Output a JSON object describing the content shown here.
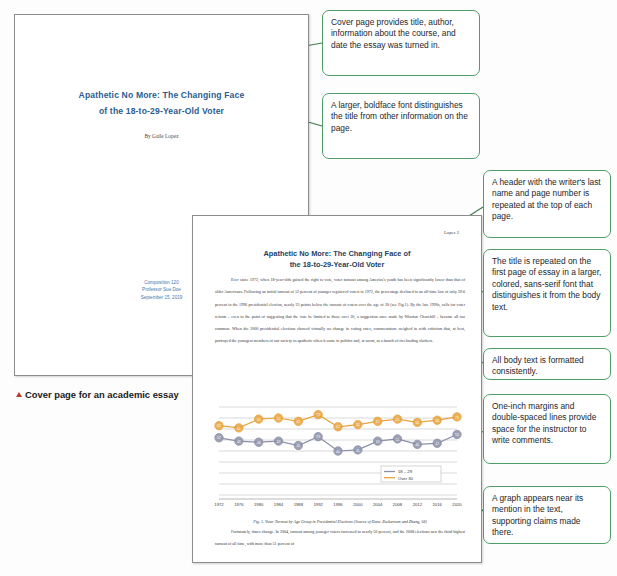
{
  "figure_label": {
    "marker": "triangle-up-icon",
    "text": "Cover page for an academic essay"
  },
  "cover_page": {
    "title_line1": "Apathetic No More: The Changing Face",
    "title_line2": "of the 18-to-29-Year-Old Voter",
    "author": "By Gaile Lopez",
    "course": "Composition 120",
    "instructor": "Professor Sue Doe",
    "date": "September 15, 2019",
    "title_color": "#2b5d8f",
    "courseinfo_color": "#3f79ad"
  },
  "essay_page": {
    "running_header": "Lopez 2",
    "title_line1": "Apathetic No More: The Changing Face of",
    "title_line2": "the 18-to-29-Year-Old Voter",
    "title_color": "#1d3f63",
    "body_paragraph_1": "Ever since 1972, when 18-year-olds gained the right to vote, voter turnout among America's youth has been significantly lower than that of older Americans. Following an initial turnout of 52 percent of younger registered voters in 1972, the percentage declined to an all-time low of only 39.6 percent in the 1996 presidential election, nearly 25 points below the turnout of voters over the age of 30 (see Fig.1). By the late 1990s, calls for voter reform – even to the point of suggesting that the vote be limited to those over 30, a suggestion once made by Winston Churchill – became all too common. When the 2000 presidential elections showed virtually no change in voting rates, commentators weighed in with criticism that, at best, portrayed the youngest members of our society as apathetic when it came to politics and, at worst, as a bunch of freeloading slackers.",
    "figure_caption": "Fig. 1. Voter Turnout by Age Group in Presidential Elections (Source of Data: Zuckerman and Zhang, 58)",
    "body_paragraph_2": "Fortunately, times change. In 2004, turnout among younger voters increased to nearly 50 percent, and the 2008 elections saw the third highest turnout of all time, with more than 51 percent of"
  },
  "chart_data": {
    "type": "line",
    "title": "",
    "xlabel": "",
    "ylabel": "",
    "grid": true,
    "legend_position": "bottom-right",
    "ylim": [
      0,
      80
    ],
    "categories": [
      "1972",
      "1976",
      "1980",
      "1984",
      "1988",
      "1992",
      "1996",
      "2000",
      "2004",
      "2008",
      "2012",
      "2016",
      "2020"
    ],
    "series": [
      {
        "name": "18 – 29",
        "color": "#8b90a8",
        "values": [
          52,
          49,
          48,
          49,
          45,
          53,
          40,
          41,
          49,
          51,
          46,
          47,
          55
        ]
      },
      {
        "name": "Over 30",
        "color": "#e8a33d",
        "values": [
          63,
          61,
          69,
          70,
          67,
          73,
          62,
          64,
          67,
          69,
          66,
          68,
          71
        ]
      }
    ]
  },
  "callouts": [
    {
      "id": "callout-cover-purpose",
      "text": "Cover page provides title, author, information about the course, and date the essay was turned in."
    },
    {
      "id": "callout-title-font",
      "text": "A larger, boldface font distinguishes the title from other information on the page."
    },
    {
      "id": "callout-header",
      "text": "A header with the writer's last name and page number is repeated at the top of each page."
    },
    {
      "id": "callout-title-repeat",
      "text": "The title is repeated on the first page of essay in a larger, colored, sans-serif font that distinguishes it from the body text."
    },
    {
      "id": "callout-body-format",
      "text": "All body text is formatted consistently."
    },
    {
      "id": "callout-margins",
      "text": "One-inch margins and double-spaced lines provide space for the instructor to write comments."
    },
    {
      "id": "callout-graph",
      "text": "A graph appears near its mention in the text, supporting claims made there."
    }
  ],
  "accent": {
    "callout_border": "#4f9e6a",
    "connector": "#3f7d52"
  }
}
